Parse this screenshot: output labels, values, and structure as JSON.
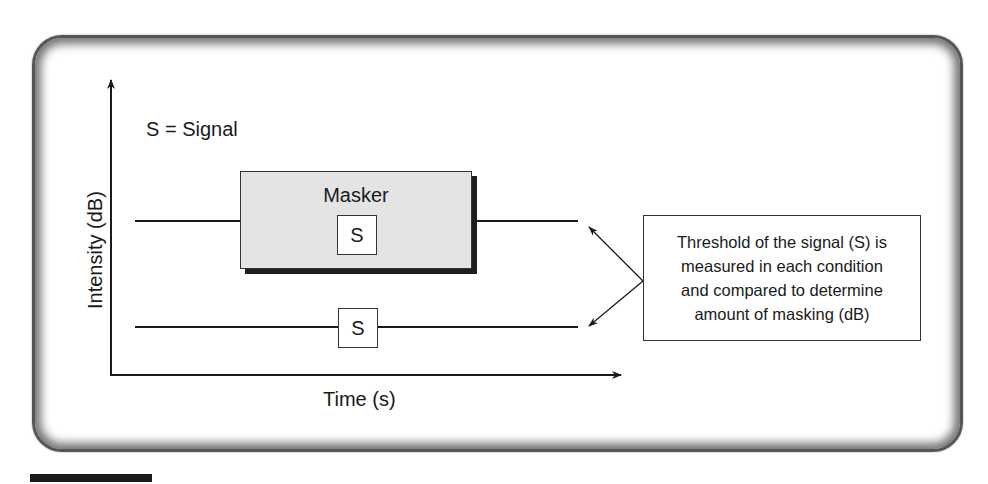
{
  "diagram": {
    "legend": "S = Signal",
    "y_axis_label": "Intensity (dB)",
    "x_axis_label": "Time (s)",
    "masker_label": "Masker",
    "signal_inside_masker": "S",
    "signal_alone": "S",
    "callout_lines": [
      "Threshold of the signal (S) is",
      "measured in each condition",
      "and compared to determine",
      "amount of masking (dB)"
    ],
    "colors": {
      "line": "#1a1a1a",
      "masker_fill": "#e4e4e4",
      "masker_shadow": "#1e1e1e",
      "frame": "#555555",
      "background": "#ffffff"
    }
  }
}
